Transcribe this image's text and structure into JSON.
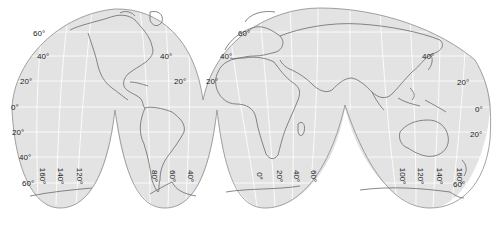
{
  "map": {
    "projection_style": "interrupted homolosine",
    "colors": {
      "land_ocean_fill": "#e3e3e3",
      "outline": "#8a8a8a",
      "graticule": "#ffffff",
      "coast": "#6a6a6a",
      "background": "#ffffff"
    },
    "latitude_labels": [
      {
        "text": "60°",
        "x": 33,
        "y": 30
      },
      {
        "text": "40°",
        "x": 37,
        "y": 53
      },
      {
        "text": "20°",
        "x": 20,
        "y": 78
      },
      {
        "text": "0°",
        "x": 11,
        "y": 104
      },
      {
        "text": "20°",
        "x": 12,
        "y": 129
      },
      {
        "text": "40°",
        "x": 19,
        "y": 154
      },
      {
        "text": "60°",
        "x": 22,
        "y": 180
      },
      {
        "text": "40°",
        "x": 160,
        "y": 53
      },
      {
        "text": "20°",
        "x": 174,
        "y": 78
      },
      {
        "text": "60°",
        "x": 238,
        "y": 30
      },
      {
        "text": "40°",
        "x": 220,
        "y": 53
      },
      {
        "text": "20°",
        "x": 206,
        "y": 78
      },
      {
        "text": "40°",
        "x": 422,
        "y": 53
      },
      {
        "text": "20°",
        "x": 457,
        "y": 79
      },
      {
        "text": "0°",
        "x": 475,
        "y": 106
      },
      {
        "text": "20°",
        "x": 470,
        "y": 131
      },
      {
        "text": "60°",
        "x": 453,
        "y": 181
      }
    ],
    "longitude_labels": [
      {
        "text": "160°",
        "x": 34,
        "y": 172
      },
      {
        "text": "140°",
        "x": 52,
        "y": 172
      },
      {
        "text": "120°",
        "x": 71,
        "y": 172
      },
      {
        "text": "80°",
        "x": 148,
        "y": 172
      },
      {
        "text": "60°",
        "x": 166,
        "y": 172
      },
      {
        "text": "40°",
        "x": 184,
        "y": 172
      },
      {
        "text": "0°",
        "x": 255,
        "y": 172
      },
      {
        "text": "20°",
        "x": 273,
        "y": 172
      },
      {
        "text": "40°",
        "x": 290,
        "y": 172
      },
      {
        "text": "60°",
        "x": 307,
        "y": 172
      },
      {
        "text": "100°",
        "x": 394,
        "y": 172
      },
      {
        "text": "120°",
        "x": 412,
        "y": 172
      },
      {
        "text": "140°",
        "x": 431,
        "y": 172
      },
      {
        "text": "160°",
        "x": 451,
        "y": 172
      }
    ]
  }
}
